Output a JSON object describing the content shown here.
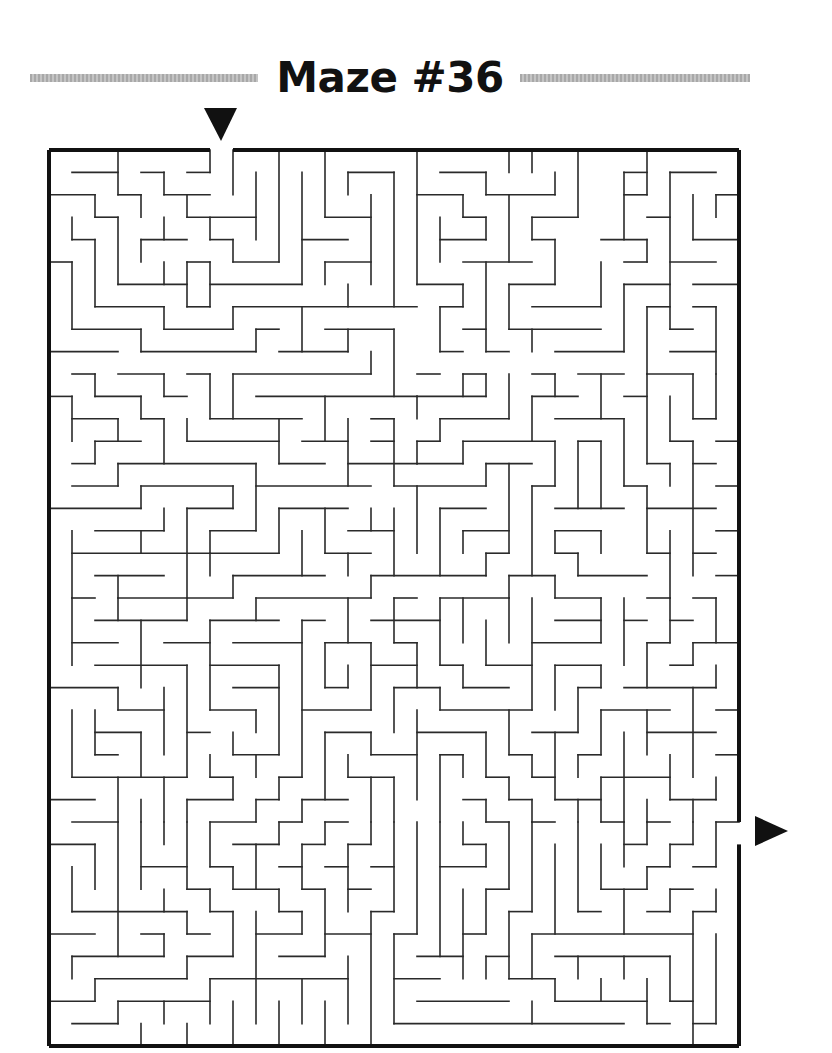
{
  "page": {
    "title": "Maze #36"
  },
  "maze": {
    "cols": 30,
    "rows": 40,
    "origin_px": [
      49,
      150
    ],
    "cell_w": 23.0,
    "cell_h": 22.4,
    "wall_color": "#2a2a2a",
    "border_color": "#111111",
    "entrance": {
      "side": "top",
      "col": 7,
      "arrow": "down-arrow"
    },
    "exit": {
      "side": "right",
      "row": 30,
      "arrow": "right-arrow"
    },
    "h_walls": {
      "1": "1-3,4-5,6-7,13-15,17-19,25-26,27-29",
      "2": "0-2,3-4,5-7,16-18,19-22,25-26,29-30",
      "3": "2-3,6-9,12-14,18-19,21-23,26-27",
      "4": "1-2,4-6,7-8,11-13,17-19,21-22,24-26,28-30",
      "5": "0-1,6-7,8-10,12-14,18-21,25-26,27-29",
      "6": "3-6,7-11,16-18,20-22,25-27,28-30",
      "7": "2-5,6-7,8-16,17-18,21-24,26-27,28-29",
      "8": "1-4,5-8,9-10,12-15,18-19,20-24,27-28",
      "9": "0-3,4-9,10-13,17-18,19-20,22-25,27-29",
      "10": "1-2,3-5,6-7,8-14,16-17,18-19,21-22,23-25,26-28",
      "11": "0-1,2-4,5-6,9-16,16-19,21-23,25-26",
      "12": "1-3,4-5,7-11,14-15,17-20,22-25,28-29",
      "13": "2-4,6-10,11-13,14-15,16-17,18-22,23-24,27-28,29-30",
      "14": "1-2,3-9,10-12,13-16,16-18,19-21,26-27,28-29",
      "15": "1-3,4-8,9-14,15-19,21-22,25-26,29-30",
      "16": "0-4,6-8,10-13,17-19,22-25,26-29",
      "17": "2-5,7-9,13-15,18-20,22-24,29-30",
      "18": "1-10,12-14,19-20,22-23,26-27,28-29",
      "19": "2-5,8-12,14-19,20-22,23-26,29-30",
      "20": "1-2,3-8,9-14,15-16,17-20,22-24,26-27,28-29",
      "21": "2-6,7-10,11-12,14-17,22-24,25-26,27-28",
      "22": "1-3,5-7,8-11,12-14,15-16,21-24,26-27,28-30",
      "23": "2-6,7-10,14-16,17-18,19-21,22-24,27-28",
      "24": "0-3,8-10,12-13,15-17,18-20,23-24,25-29",
      "25": "3-5,7-9,11-14,17-21,24-27,29-30",
      "26": "2-4,6-7,12-14,16-19,21-23,26-29",
      "27": "2-3,8-10,14-16,17-18,20-21,23-24,29-30",
      "28": "1-6,7-8,10-11,13-15,19-20,21-22,24-27",
      "29": "0-2,6-8,9-10,11-13,18-19,20-21,22-24,27-29",
      "30": "1-3,7-9,10-11,12-13,19-20,21-22,24-25,26-27,29-30",
      "31": "0-2,8-10,11-12,13-14,18-19,25-26,27-28",
      "32": "4-6,7-8,10-11,12-13,14-15,17-19,26-27,28-29",
      "33": "6-7,8-10,11-12,13-14,19-20,24-26,27-28",
      "34": "1-6,7-8,10-11,14-15,20-21,23-24,26-27,28-29",
      "35": "0-2,4-5,6-7,9-11,12-14,15-16,18-19,21-28",
      "36": "1-5,6-8,10-12,16-18,19-20,22-27",
      "37": "2-6,7-13,15-17,20-22",
      "38": "0-2,3-7,16-20,22-26,27-28",
      "39": "1-3,15-25,26-27,28-29"
    },
    "v_walls": {
      "1": "3-4,5-8,11-13,17-20,20-23,25-28,32-34,36-37",
      "2": "2-3,4-7,10-11,13-14,25-27,31-33,37-38",
      "3": "0-2,3-6,12-13,14-15,19-20,20-21,24-25,28-30,30-36,38-39",
      "4": "2-3,4-5,8-9,11-12,15-16,17-18,21-24,26-28,29-30,30-33,39-40",
      "5": "1-2,3-4,5-6,7-8,10-11,12-14,16-17,24-27,28-30,30-31,33-34,35-36,38-39",
      "6": "2-3,5-7,12-13,16-20,20-21,23-28,29-30,30-33,34-35,36-37,39-40",
      "7": "0-1,3-4,5-7,10-12,17-18,18-19,21-25,27-28,30-32,33-34,37-39",
      "8": "0-2,4-5,7-8,10-12,15-16,19-20,26-27,28-29,32-33,34-36,38-40",
      "9": "1-4,8-9,14-17,20-21,25-26,27-28,29-30,31-33,34-39",
      "10": "0-5,12-14,16-18,23-27,28-29,30-31,33-34,38-40",
      "11": "1-6,7-9,17-19,21-28,29-30,31-33,34-35,37-39",
      "12": "0-3,5-6,11-13,16-18,22-24,26-29,30-31,33-36,38-40",
      "13": "1-2,6-7,8-9,12-15,18-19,20-22,23-24,27-28,31-34,36-39",
      "14": "2-6,9-10,16-17,19-20,22-25,26-27,28-30,30-31,34-40",
      "15": "1-7,8-11,12-15,16-19,20-22,24-26,28-30,30-34,35-39",
      "16": "0-6,11-12,13-14,15-18,22-24,25-29,30-35",
      "17": "3-5,7-9,12-13,16-19,20-23,24-25,27-30,30-36",
      "18": "2-3,6-7,10-11,13-14,17-18,20-22,23-24,27-28,30-31,33-37",
      "19": "1-2,3-4,5-9,10-11,14-15,18-19,21-23,26-28,29-30,31-32,33-35,36-37",
      "20": "0-1,2-5,6-8,10-12,14-18,19-20,20-22,25-27,28-29,30-33,34-37",
      "21": "0-1,3-4,8-9,11-13,15-19,20-25,27-28,29-30,30-34,35-37,38-39",
      "22": "1-2,4-6,10-11,13-15,17-18,19-20,23-25,26-29,31-35,37-38",
      "23": "0-3,13-16,18-19,24-26,27-28,29-30,30-34,36-37",
      "24": "5-7,10-12,13-16,17-18,20-22,23-24,25-27,28-30,31-33,37-38",
      "25": "1-4,6-9,12-15,20-23,26-30,30-32,33-35,36-37",
      "26": "0-2,4-5,7-10,10-14,15-18,22-24,25-27,29-30,30-31,32-33,37-39",
      "27": "1-8,11-13,14-15,17-20,20-22,27-29,31-32,33-34,36-38",
      "28": "2-4,10-12,13-19,22-23,24-28,29-30,30-31,34-40",
      "29": "2-3,7-10,10-12,20-22,23-24,28-29,30-32,33-34,35-39"
    }
  }
}
